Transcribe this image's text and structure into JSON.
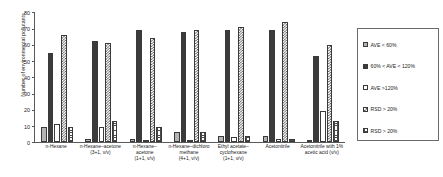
{
  "chart_data": {
    "type": "bar",
    "title": "",
    "subtitle": "",
    "xlabel": "",
    "ylabel": "Number of environmental pollutants",
    "ylim": [
      0,
      80
    ],
    "yticks": [
      0,
      10,
      20,
      30,
      40,
      50,
      60,
      70,
      80
    ],
    "grid": false,
    "legend_position": "right",
    "categories": [
      "n-Hexane",
      "n-Hexane–acetone (3+1, v/v)",
      "n-Hexane–acetone (1+1, v/v)",
      "n-Hexane–dichloro methane (4+1, v/v)",
      "Ethyl acetate–cyclohexane (1+1, v/v)",
      "Acetonitrile",
      "Acetonitrile with 1% acetic acid (v/v)"
    ],
    "series": [
      {
        "name": "AVE < 60%",
        "pattern": "solid-light-grey",
        "values": [
          9,
          2,
          2,
          6,
          4,
          4,
          1
        ]
      },
      {
        "name": "60% < AVE < 120%",
        "pattern": "solid-dark",
        "values": [
          55,
          62,
          69,
          68,
          69,
          69,
          53
        ]
      },
      {
        "name": "AVE >120%",
        "pattern": "empty-white",
        "values": [
          11,
          9,
          1,
          1,
          3,
          2,
          19
        ]
      },
      {
        "name": "RSD > 20%",
        "pattern": "coarse-checker",
        "values": [
          66,
          61,
          64,
          69,
          71,
          74,
          60
        ]
      },
      {
        "name": "RSD > 20%",
        "pattern": "fine-grid",
        "values": [
          9,
          13,
          9,
          6,
          4,
          2,
          13
        ]
      }
    ]
  },
  "axis": {
    "y_title": "Number of environmental pollutants",
    "y_tick_labels": [
      "0",
      "10",
      "20",
      "30",
      "40",
      "50",
      "60",
      "70",
      "80"
    ]
  },
  "xaxis": {
    "labels": [
      [
        "n-Hexane"
      ],
      [
        "n-Hexane–acetone",
        "(3+1, v/v)"
      ],
      [
        "n-Hexane–",
        "acetone",
        "(1+1, v/v)"
      ],
      [
        "n-Hexane–dichloro",
        "methane",
        "(4+1, v/v)"
      ],
      [
        "Ethyl acetate–",
        "cyclohexane",
        "(1+1, v/v)"
      ],
      [
        "Acetonitrile"
      ],
      [
        "Acetonitrile with 1%",
        "acetic acid (v/v)"
      ]
    ]
  },
  "legend": {
    "items": [
      {
        "label": "AVE < 60%",
        "pattern": "solid-light-grey"
      },
      {
        "label": "60% < AVE < 120%",
        "pattern": "solid-dark"
      },
      {
        "label": "AVE >120%",
        "pattern": "empty-white"
      },
      {
        "label": "RSD > 20%",
        "pattern": "coarse-checker"
      },
      {
        "label": "RSD > 20%",
        "pattern": "fine-grid"
      }
    ]
  },
  "colors": {
    "ave_lt60": "#b4b4b4",
    "ave_mid": "#3b3b3b",
    "ave_gt120": "#ffffff",
    "rsd_a": "#585858",
    "rsd_b": "#4a4a4a",
    "axis": "#5a5a5a",
    "text": "#1a1a1a"
  }
}
